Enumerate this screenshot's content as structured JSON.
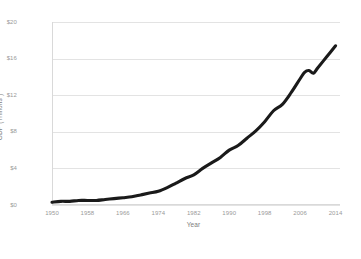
{
  "chart_data": {
    "type": "line",
    "title": "",
    "xlabel": "Year",
    "ylabel": "GDP (Trillions )",
    "xlim": [
      1950,
      2015
    ],
    "ylim": [
      0,
      20
    ],
    "grid": true,
    "legend": false,
    "legend_position": "none",
    "line_color": "#1a1a1a",
    "gridline_color": "#e3e3e3",
    "tick_label_color": "#9a9a9a",
    "background_color": "#ffffff",
    "x_tick_labels": [
      "1950",
      "1958",
      "1966",
      "1974",
      "1982",
      "1990",
      "1998",
      "2006",
      "2014"
    ],
    "x_tick_values": [
      1950,
      1958,
      1966,
      1974,
      1982,
      1990,
      1998,
      2006,
      2014
    ],
    "y_tick_labels": [
      "$0",
      "$4",
      "$8",
      "$12",
      "$16",
      "$20"
    ],
    "y_tick_values": [
      0,
      4,
      8,
      12,
      16,
      20
    ],
    "series": [
      {
        "name": "GDP",
        "x": [
          1950,
          1952,
          1954,
          1956,
          1958,
          1960,
          1962,
          1964,
          1966,
          1968,
          1970,
          1972,
          1974,
          1976,
          1978,
          1980,
          1982,
          1984,
          1986,
          1988,
          1990,
          1992,
          1994,
          1996,
          1998,
          2000,
          2002,
          2004,
          2006,
          2007,
          2008,
          2009,
          2010,
          2012,
          2014
        ],
        "values": [
          0.3,
          0.4,
          0.4,
          0.5,
          0.5,
          0.5,
          0.6,
          0.7,
          0.8,
          0.9,
          1.1,
          1.3,
          1.5,
          1.9,
          2.4,
          2.9,
          3.3,
          4.0,
          4.6,
          5.2,
          6.0,
          6.5,
          7.3,
          8.1,
          9.1,
          10.3,
          11.0,
          12.3,
          13.8,
          14.5,
          14.7,
          14.4,
          15.0,
          16.2,
          17.4
        ]
      }
    ],
    "annotations": []
  }
}
